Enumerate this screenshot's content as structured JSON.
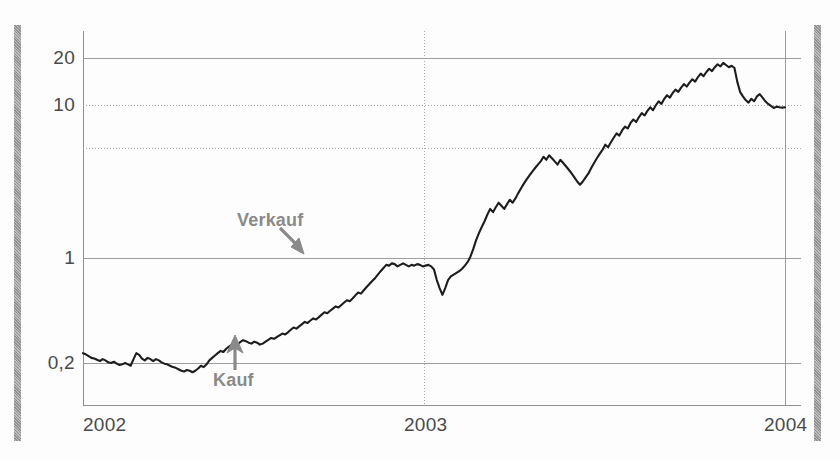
{
  "chart_data": {
    "type": "line",
    "title": "",
    "xlabel": "",
    "ylabel": "",
    "scale": "log",
    "grid": true,
    "legend": null,
    "xticks": [
      "2002",
      "2003",
      "2004"
    ],
    "xtick_values": [
      2002,
      2003,
      2004
    ],
    "yticks": [
      "20",
      "10",
      "1",
      "0,2"
    ],
    "ytick_values": [
      20,
      10,
      1,
      0.2
    ],
    "unlabeled_gridlines": [
      5
    ],
    "ylim": [
      0.12,
      32
    ],
    "xlim": [
      2002.0,
      2004.05
    ],
    "annotations": [
      {
        "label": "Verkauf",
        "arrow": "down-right",
        "x": 2002.62,
        "y": 1.0,
        "color": "#8a8a8a"
      },
      {
        "label": "Kauf",
        "arrow": "up",
        "x": 2002.3,
        "y": 0.26,
        "color": "#8a8a8a"
      }
    ],
    "series": [
      {
        "name": "",
        "color": "#1d1d1d",
        "x": [
          2002.0,
          2002.008,
          2002.016,
          2002.024,
          2002.032,
          2002.04,
          2002.048,
          2002.056,
          2002.064,
          2002.072,
          2002.08,
          2002.088,
          2002.096,
          2002.104,
          2002.112,
          2002.12,
          2002.128,
          2002.136,
          2002.144,
          2002.152,
          2002.16,
          2002.168,
          2002.176,
          2002.184,
          2002.192,
          2002.2,
          2002.208,
          2002.216,
          2002.224,
          2002.232,
          2002.24,
          2002.248,
          2002.256,
          2002.264,
          2002.272,
          2002.28,
          2002.288,
          2002.296,
          2002.304,
          2002.312,
          2002.32,
          2002.328,
          2002.336,
          2002.344,
          2002.352,
          2002.36,
          2002.368,
          2002.376,
          2002.384,
          2002.392,
          2002.4,
          2002.408,
          2002.416,
          2002.424,
          2002.432,
          2002.44,
          2002.448,
          2002.456,
          2002.464,
          2002.472,
          2002.48,
          2002.488,
          2002.496,
          2002.504,
          2002.512,
          2002.52,
          2002.528,
          2002.536,
          2002.544,
          2002.552,
          2002.56,
          2002.568,
          2002.576,
          2002.584,
          2002.592,
          2002.6,
          2002.608,
          2002.616,
          2002.624,
          2002.632,
          2002.64,
          2002.648,
          2002.656,
          2002.664,
          2002.672,
          2002.68,
          2002.688,
          2002.696,
          2002.704,
          2002.712,
          2002.72,
          2002.728,
          2002.736,
          2002.744,
          2002.752,
          2002.76,
          2002.768,
          2002.776,
          2002.784,
          2002.792,
          2002.8,
          2002.808,
          2002.816,
          2002.824,
          2002.832,
          2002.84,
          2002.848,
          2002.856,
          2002.864,
          2002.872,
          2002.88,
          2002.888,
          2002.896,
          2002.904,
          2002.912,
          2002.92,
          2002.928,
          2002.936,
          2002.944,
          2002.952,
          2002.96,
          2002.968,
          2002.976,
          2002.984,
          2002.992,
          2003.0,
          2003.008,
          2003.016,
          2003.024,
          2003.032,
          2003.04,
          2003.048,
          2003.056,
          2003.064,
          2003.072,
          2003.08,
          2003.088,
          2003.096,
          2003.104,
          2003.112,
          2003.12,
          2003.128,
          2003.136,
          2003.144,
          2003.152,
          2003.16,
          2003.168,
          2003.176,
          2003.184,
          2003.192,
          2003.2,
          2003.208,
          2003.216,
          2003.224,
          2003.232,
          2003.24,
          2003.248,
          2003.256,
          2003.264,
          2003.272,
          2003.28,
          2003.288,
          2003.296,
          2003.304,
          2003.312,
          2003.32,
          2003.328,
          2003.336,
          2003.344,
          2003.352,
          2003.36,
          2003.368,
          2003.376,
          2003.384,
          2003.392,
          2003.4,
          2003.408,
          2003.416,
          2003.424,
          2003.432,
          2003.44,
          2003.448,
          2003.456,
          2003.464,
          2003.472,
          2003.48,
          2003.488,
          2003.496,
          2003.504,
          2003.512,
          2003.52,
          2003.528,
          2003.536,
          2003.544,
          2003.552,
          2003.56,
          2003.568,
          2003.576,
          2003.584,
          2003.592,
          2003.6,
          2003.608,
          2003.616,
          2003.624,
          2003.632,
          2003.64,
          2003.648,
          2003.656,
          2003.664,
          2003.672,
          2003.68,
          2003.688,
          2003.696,
          2003.704,
          2003.712,
          2003.72,
          2003.728,
          2003.736,
          2003.744,
          2003.752,
          2003.76,
          2003.768,
          2003.776,
          2003.784,
          2003.792,
          2003.8,
          2003.808,
          2003.816,
          2003.824,
          2003.832,
          2003.84,
          2003.848,
          2003.856,
          2003.864,
          2003.872,
          2003.88,
          2003.888,
          2003.896,
          2003.904,
          2003.912,
          2003.92,
          2003.928,
          2003.936,
          2003.944,
          2003.952,
          2003.96,
          2003.968,
          2003.976,
          2003.984,
          2003.992,
          2004.0
        ],
        "y": [
          0.232,
          0.228,
          0.222,
          0.216,
          0.214,
          0.21,
          0.206,
          0.212,
          0.208,
          0.202,
          0.2,
          0.204,
          0.198,
          0.194,
          0.196,
          0.2,
          0.196,
          0.192,
          0.212,
          0.232,
          0.226,
          0.214,
          0.208,
          0.216,
          0.212,
          0.206,
          0.212,
          0.208,
          0.202,
          0.198,
          0.196,
          0.192,
          0.188,
          0.186,
          0.182,
          0.178,
          0.176,
          0.18,
          0.178,
          0.174,
          0.178,
          0.184,
          0.192,
          0.188,
          0.196,
          0.208,
          0.216,
          0.224,
          0.232,
          0.24,
          0.236,
          0.248,
          0.256,
          0.264,
          0.258,
          0.266,
          0.274,
          0.282,
          0.278,
          0.272,
          0.268,
          0.276,
          0.272,
          0.264,
          0.268,
          0.276,
          0.284,
          0.292,
          0.288,
          0.296,
          0.304,
          0.312,
          0.308,
          0.318,
          0.33,
          0.342,
          0.336,
          0.348,
          0.36,
          0.372,
          0.366,
          0.38,
          0.392,
          0.386,
          0.4,
          0.415,
          0.43,
          0.424,
          0.44,
          0.455,
          0.47,
          0.462,
          0.48,
          0.498,
          0.516,
          0.508,
          0.53,
          0.555,
          0.58,
          0.57,
          0.6,
          0.63,
          0.66,
          0.69,
          0.72,
          0.76,
          0.8,
          0.84,
          0.88,
          0.87,
          0.9,
          0.89,
          0.86,
          0.88,
          0.9,
          0.88,
          0.86,
          0.88,
          0.87,
          0.89,
          0.88,
          0.86,
          0.87,
          0.88,
          0.86,
          0.82,
          0.7,
          0.62,
          0.56,
          0.62,
          0.7,
          0.74,
          0.76,
          0.78,
          0.8,
          0.83,
          0.87,
          0.92,
          1.0,
          1.12,
          1.28,
          1.42,
          1.56,
          1.7,
          1.88,
          2.05,
          1.95,
          2.1,
          2.25,
          2.15,
          2.05,
          2.2,
          2.35,
          2.25,
          2.4,
          2.6,
          2.8,
          3.0,
          3.2,
          3.4,
          3.6,
          3.8,
          4.0,
          4.2,
          4.5,
          4.3,
          4.6,
          4.4,
          4.2,
          4.0,
          4.3,
          4.1,
          3.9,
          3.7,
          3.5,
          3.3,
          3.1,
          2.95,
          3.1,
          3.3,
          3.5,
          3.8,
          4.1,
          4.4,
          4.7,
          5.0,
          5.4,
          5.2,
          5.6,
          6.0,
          6.4,
          6.2,
          6.7,
          7.1,
          6.9,
          7.5,
          7.9,
          7.6,
          8.2,
          8.7,
          8.4,
          9.0,
          9.5,
          9.1,
          9.8,
          10.4,
          10.0,
          10.8,
          11.4,
          11.0,
          11.8,
          12.4,
          12.0,
          12.8,
          13.5,
          13.0,
          13.8,
          14.5,
          14.0,
          15.0,
          15.8,
          15.2,
          16.2,
          17.0,
          16.4,
          17.4,
          18.2,
          17.6,
          18.6,
          18.0,
          17.4,
          17.8,
          17.2,
          14.0,
          12.0,
          11.2,
          10.6,
          10.2,
          10.8,
          10.4,
          11.2,
          11.6,
          11.0,
          10.4,
          10.0,
          9.7,
          9.4,
          9.6,
          9.5,
          9.45,
          9.5
        ]
      }
    ]
  },
  "axes": {
    "y_labels": [
      {
        "text": "20",
        "value": 20
      },
      {
        "text": "10",
        "value": 10
      },
      {
        "text": "1",
        "value": 1
      },
      {
        "text": "0,2",
        "value": 0.2
      }
    ],
    "x_labels": [
      {
        "text": "2002",
        "value": 2002
      },
      {
        "text": "2003",
        "value": 2003
      },
      {
        "text": "2004",
        "value": 2004
      }
    ]
  },
  "colors": {
    "curve": "#1d1d1d",
    "grid": "#a6a6a6",
    "axis": "#8f8f8f",
    "annotation": "#8a8a8a",
    "tick_text": "#4a4a4a",
    "margin_bar": "#a3a3a3",
    "background": "#fdfdfd"
  }
}
